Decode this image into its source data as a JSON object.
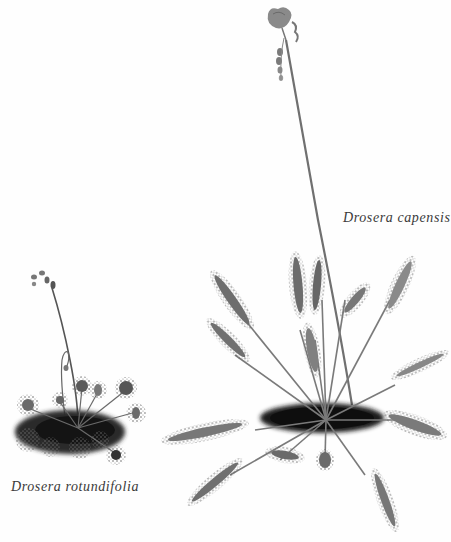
{
  "plate": {
    "background": "#fefefe",
    "ink_color": "#3a3a3a",
    "specimens": [
      {
        "id": "capensis",
        "caption": "Drosera capensis",
        "description": "Tall sundew with long strap-like glandular leaves in a rosette and a single tall flower stalk topped by a pink flower and buds"
      },
      {
        "id": "rotundifolia",
        "caption": "Drosera rotundifolia",
        "description": "Small sundew with round glandular leaves on petioles in a rosette and a slender curved flower stalk with buds"
      }
    ]
  }
}
